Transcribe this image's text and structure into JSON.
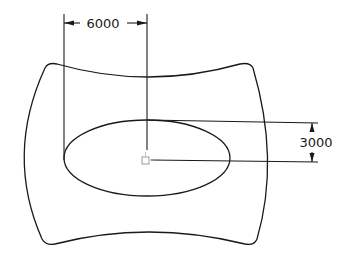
{
  "diagram": {
    "type": "technical-drawing",
    "dimensions": {
      "horizontal": {
        "label": "6000",
        "from": "ellipse-left",
        "to": "ellipse-center"
      },
      "vertical": {
        "label": "3000",
        "from": "ellipse-top",
        "to": "ellipse-center"
      }
    },
    "center_marker": "square-snap-icon",
    "stroke_color": "#1a1a1a"
  }
}
